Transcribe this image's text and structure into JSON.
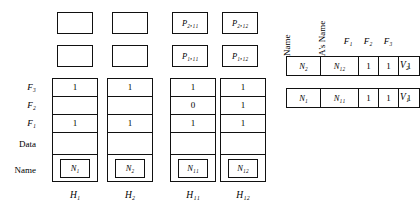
{
  "diagram": {
    "row_labels": [
      {
        "id": "f3",
        "text": "F₃"
      },
      {
        "id": "f2",
        "text": "F₂"
      },
      {
        "id": "f1",
        "text": "F₁"
      },
      {
        "id": "data",
        "text": "Data"
      },
      {
        "id": "name",
        "text": "Name"
      }
    ],
    "nodes": [
      {
        "id": "h1",
        "caption": "H₁",
        "pointer_top": "",
        "pointer_mid": "",
        "cells": {
          "f3": "1",
          "f2": "",
          "f1": "1",
          "data": "",
          "name": "N₁"
        }
      },
      {
        "id": "h2",
        "caption": "H₂",
        "pointer_top": "",
        "pointer_mid": "",
        "cells": {
          "f3": "1",
          "f2": "",
          "f1": "1",
          "data": "",
          "name": "N₂"
        }
      },
      {
        "id": "h11",
        "caption": "H₁₁",
        "pointer_top": "P₂,₁₁",
        "pointer_mid": "P₁,₁₁",
        "cells": {
          "f3": "1",
          "f2": "0",
          "f1": "1",
          "data": "",
          "name": "N₁₁"
        }
      },
      {
        "id": "h12",
        "caption": "H₁₂",
        "pointer_top": "P₂,₁₂",
        "pointer_mid": "P₁,₁₂",
        "cells": {
          "f3": "1",
          "f2": "1",
          "f1": "1",
          "data": "",
          "name": "N₁₂"
        }
      }
    ],
    "relation": {
      "headers": {
        "name": "Name",
        "ancestor_name": "A's Name",
        "f1": "F₁",
        "f2": "F₂",
        "f3": "F₃"
      },
      "rows": [
        {
          "id": "v2",
          "label": "V₂",
          "name": "N₂",
          "ancestor_name": "N₁₂",
          "flags": [
            "1",
            "1",
            "1"
          ]
        },
        {
          "id": "v1",
          "label": "V₁",
          "name": "N₁",
          "ancestor_name": "N₁₁",
          "flags": [
            "1",
            "1",
            "1"
          ]
        }
      ]
    }
  }
}
